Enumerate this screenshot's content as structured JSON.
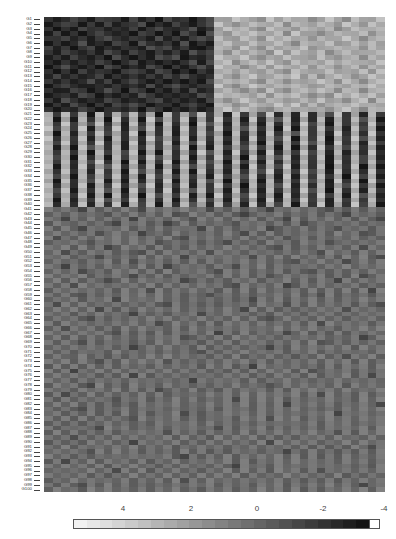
{
  "chart_data": {
    "type": "heatmap",
    "title": "",
    "xlabel": "",
    "ylabel": "",
    "row_labels_prefix": "G",
    "n_rows": 100,
    "n_cols": 40,
    "legend": {
      "type": "colorbar",
      "position": "bottom",
      "tick_labels": [
        "4",
        "2",
        "0",
        "-2",
        "-4"
      ],
      "tick_positions_px": [
        123,
        191,
        257,
        323,
        384
      ],
      "range": [
        4,
        -4
      ],
      "color_light": "#f2f2f2",
      "color_dark": "#141414",
      "end_cell_color": "#ffffff"
    },
    "value_encoding": "each char 0-9 maps linearly from +4 (0, light) to -4 (9, dark)",
    "blocks": [
      {
        "rows": "G1-G20",
        "cols": "1-20",
        "level": "low (~-3, dark)"
      },
      {
        "rows": "G1-G20",
        "cols": "21-40",
        "level": "high (~+2, light)"
      },
      {
        "rows": "G21-G40",
        "cols": "alternating",
        "level": "odd cols light (~+2), even cols dark (~-3)"
      },
      {
        "rows": "G41-G100",
        "cols": "1-40",
        "level": "near 0 to -1 (mid gray)"
      }
    ],
    "rows": [
      "8987897889798978898733233423233432342332",
      "9878989798879897898723432332423323423423",
      "8989788989798789879832323423342332432332",
      "9798987898978989789734232332423343233243",
      "8879898789889798987823423423233423323432",
      "9898798978978989798932332332342332432323",
      "7989879898897879899823423423332433233423",
      "8978989789789898978734232342423324323332",
      "9897898978989787989823323433233423432423",
      "8989897898798989879732432323423332323332",
      "9878989789897898987823343242332423432423",
      "8989798898789789898932323423423332333242",
      "9798987989898978789823432332324243234323",
      "8989879798789898989732323423433323423432",
      "9878998989897987898823432332323432332323",
      "8997898789789898979832343423432323423432",
      "9889789898978989897823233242323434232323",
      "8978989789898798989734323423432323343242",
      "9897898978789889878923432332324243232333",
      "8989789889897898989832323443233334323423",
      "3828392837283928372839283728392837283928",
      "2939283928392738293828392837293829382739",
      "3828372839283928392739283928382739283828",
      "2738293829372839283828372839293828392739",
      "3929382738293829382739283928372839283828",
      "2838293928382738293828392837293829382739",
      "3728382839293829372839283928382739283928",
      "2939273829382838293928372839293828372839",
      "3828392837293928382739283928382739293828",
      "2739283928382738293828392837293829382739",
      "3828372839293829382739283928382839283728",
      "2939283728382938273828392837293829382939",
      "3828392839273829392839283728382739283828",
      "2739283828392738283928372839293828392739",
      "3928372939283829382739283928382739283928",
      "2838293828372938293828392837293829372839",
      "3729382739283829372839283928382739283928",
      "2838293928392738293928372839293828392739",
      "3929382738283829382739283928382839283828",
      "2838293829372938273828392837293829382739",
      "5656756565675656565756565675656567565656",
      "6565656756565657656565676565656565675656",
      "5675656565756565675656565656756565656567",
      "6566565675656576565656756565657656565656",
      "5656756565656565657565656576565656756565",
      "6565657656576565656565675656565656565765",
      "5756565656565656756565656565765656565656",
      "6565675656565765656567565656565657656565",
      "5656565765656565656565656567565656565756",
      "6575656565675656565756565656565675656565",
      "5656567565656565756565657565656565656567",
      "6565656565756565656565656565675656576565",
      "5675656565656576565656756565656565656565",
      "6565765656565656565675656565656756565656",
      "5656565656756565656565656576565656565765",
      "6565656765656565765656565656565656756565",
      "5657565656565656565656756565765656565656",
      "6565656565657565656565656565656565656575",
      "5656756565656565656765656565656575656565",
      "6565656575656565656565657565656565656565",
      "5756565656565675656565656565756565656567",
      "6565657565656565656565675656565656575656",
      "5656565656756565657565656565656565656565",
      "6565675656565656565656565676565656565656",
      "5656565656565765656565656565656575656565",
      "6575656565656565656565656565656565656565",
      "5656565675656565656575656565765656565656",
      "6565656565656565765656565656565656565765",
      "5656756565656565656565656565656576565656",
      "6565656565765656565656565675656565656565",
      "5656565656565656567565656565656565656565",
      "6566565656565656565656565656565656575656",
      "5656567565656575656565656565656565656565",
      "6565656565656565656565657565656565656565",
      "5657565656565656565656565656565765656565",
      "6565656565756565656565656565656565656575",
      "5656565656565656575656565656565656565656",
      "6565675656565656565656565676565656565656",
      "5656565656565765656565656565656565656565",
      "6575656565656565656565656565656575656565",
      "5656565675656565656565756565656565656565",
      "6565656565656565656565656565756565656567",
      "5656756565656565656565656565656565656565",
      "6565656565656565756565656565656565756565",
      "5656565656756565656565656575656565656565",
      "6565656565656565656565656565656565656565",
      "5656567565656565656575656565656565656565",
      "6565656565656575656565656565656565756565",
      "5657565656565656565656565656565656565656",
      "6565656565756565656565656575656565656565",
      "5656565656565656565656565656565656565675",
      "6565675656565656565656565656756565656565",
      "5656565656565656756565656565656565656565",
      "6575656565656565656565656565656565656565",
      "5656565656565656565656756565656565656565",
      "6565656575656565656565656565656575656565",
      "5656565656565656565656565656565656565656",
      "6565656565656565756565656565656565656565",
      "5656756565656565656565656565656565656765",
      "6565656565656565656565656565656565656565"
    ]
  }
}
